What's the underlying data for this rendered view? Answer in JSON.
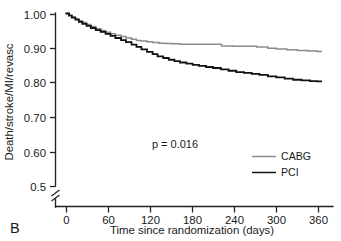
{
  "panel": {
    "label": "B"
  },
  "chart_data": {
    "type": "line",
    "title": "",
    "subtitle": "",
    "xlabel": "Time since randomization (days)",
    "ylabel": "Death/stroke/MI/revasc",
    "xlim": [
      0,
      375
    ],
    "ylim": [
      0.5,
      1.0
    ],
    "xticks": [
      0,
      60,
      120,
      180,
      240,
      300,
      360
    ],
    "xtick_labels": [
      "0",
      "60",
      "120",
      "180",
      "240",
      "300",
      "360"
    ],
    "yticks": [
      0.5,
      0.6,
      0.7,
      0.8,
      0.9,
      1.0
    ],
    "ytick_labels": [
      "0.5",
      "0.60",
      "0.70",
      "0.80",
      "0.90",
      "1.00"
    ],
    "y_axis_break": true,
    "y_axis_break_note": "axis broken below 0.5",
    "grid": false,
    "legend_position": "right-middle",
    "annotations": [
      {
        "name": "p-value",
        "text": "p = 0.016",
        "x": 175,
        "y": 0.645
      }
    ],
    "series": [
      {
        "name": "CABG",
        "color": "#8a8a8a",
        "line_width": 1.5,
        "step": "post",
        "points": [
          [
            0,
            1.0
          ],
          [
            5,
            0.995
          ],
          [
            9,
            0.99
          ],
          [
            14,
            0.985
          ],
          [
            19,
            0.979
          ],
          [
            24,
            0.974
          ],
          [
            30,
            0.968
          ],
          [
            36,
            0.962
          ],
          [
            43,
            0.956
          ],
          [
            50,
            0.951
          ],
          [
            57,
            0.946
          ],
          [
            64,
            0.941
          ],
          [
            71,
            0.937
          ],
          [
            79,
            0.933
          ],
          [
            86,
            0.929
          ],
          [
            94,
            0.925
          ],
          [
            101,
            0.922
          ],
          [
            108,
            0.92
          ],
          [
            116,
            0.918
          ],
          [
            124,
            0.916
          ],
          [
            133,
            0.914
          ],
          [
            142,
            0.913
          ],
          [
            152,
            0.912
          ],
          [
            163,
            0.911
          ],
          [
            175,
            0.911
          ],
          [
            190,
            0.911
          ],
          [
            205,
            0.911
          ],
          [
            222,
            0.906
          ],
          [
            238,
            0.905
          ],
          [
            255,
            0.905
          ],
          [
            272,
            0.903
          ],
          [
            288,
            0.899
          ],
          [
            300,
            0.897
          ],
          [
            315,
            0.895
          ],
          [
            330,
            0.893
          ],
          [
            345,
            0.891
          ],
          [
            358,
            0.89
          ],
          [
            365,
            0.89
          ]
        ]
      },
      {
        "name": "PCI",
        "color": "#111111",
        "line_width": 1.8,
        "step": "post",
        "points": [
          [
            0,
            1.0
          ],
          [
            5,
            0.994
          ],
          [
            9,
            0.988
          ],
          [
            14,
            0.982
          ],
          [
            19,
            0.976
          ],
          [
            24,
            0.97
          ],
          [
            30,
            0.964
          ],
          [
            36,
            0.958
          ],
          [
            43,
            0.952
          ],
          [
            50,
            0.947
          ],
          [
            57,
            0.941
          ],
          [
            64,
            0.935
          ],
          [
            71,
            0.929
          ],
          [
            79,
            0.923
          ],
          [
            86,
            0.917
          ],
          [
            94,
            0.91
          ],
          [
            101,
            0.903
          ],
          [
            108,
            0.896
          ],
          [
            116,
            0.889
          ],
          [
            124,
            0.882
          ],
          [
            131,
            0.876
          ],
          [
            139,
            0.871
          ],
          [
            147,
            0.866
          ],
          [
            155,
            0.862
          ],
          [
            163,
            0.858
          ],
          [
            172,
            0.855
          ],
          [
            181,
            0.851
          ],
          [
            190,
            0.848
          ],
          [
            200,
            0.845
          ],
          [
            210,
            0.842
          ],
          [
            221,
            0.838
          ],
          [
            232,
            0.834
          ],
          [
            243,
            0.83
          ],
          [
            254,
            0.828
          ],
          [
            265,
            0.825
          ],
          [
            276,
            0.822
          ],
          [
            288,
            0.818
          ],
          [
            300,
            0.815
          ],
          [
            312,
            0.811
          ],
          [
            324,
            0.808
          ],
          [
            336,
            0.806
          ],
          [
            348,
            0.804
          ],
          [
            358,
            0.803
          ],
          [
            365,
            0.803
          ]
        ]
      }
    ],
    "legend": [
      {
        "label": "CABG",
        "color": "#8a8a8a"
      },
      {
        "label": "PCI",
        "color": "#111111"
      }
    ]
  }
}
